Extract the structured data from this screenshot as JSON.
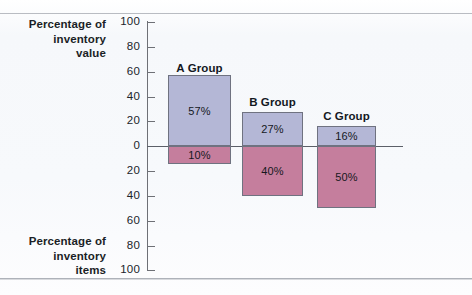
{
  "chart_data": {
    "type": "bar",
    "title": "",
    "subtitle": "",
    "orientation": "vertical-diverging",
    "categories": [
      "A Group",
      "B Group",
      "C Group"
    ],
    "series": [
      {
        "name": "Percentage of inventory value",
        "direction": "up",
        "color": "#b4b7d6",
        "values": [
          57,
          27,
          16
        ],
        "labels": [
          "57%",
          "27%",
          "16%"
        ]
      },
      {
        "name": "Percentage of inventory items",
        "direction": "down",
        "color": "#c57e9d",
        "values": [
          10,
          40,
          50
        ],
        "labels": [
          "10%",
          "40%",
          "50%"
        ]
      }
    ],
    "upper_axis_label": "Percentage of inventory value",
    "lower_axis_label": "Percentage of inventory items",
    "upper_axis_label_lines": [
      "Percentage of",
      "inventory",
      "value"
    ],
    "lower_axis_label_lines": [
      "Percentage of",
      "inventory",
      "items"
    ],
    "xlabel": "",
    "ylabel": "",
    "ylim": [
      -100,
      100
    ],
    "tick_step": 20,
    "upper_ticks": [
      100,
      80,
      60,
      40,
      20,
      0
    ],
    "lower_ticks": [
      20,
      40,
      60,
      80,
      100
    ],
    "tick_labels": [
      "100",
      "80",
      "60",
      "40",
      "20",
      "0",
      "20",
      "40",
      "60",
      "80",
      "100"
    ],
    "grid": false,
    "legend": "none",
    "baseline_value": 0
  },
  "axis": {
    "ticks": [
      {
        "label": "100",
        "y": 22
      },
      {
        "label": "80",
        "y": 47
      },
      {
        "label": "60",
        "y": 72
      },
      {
        "label": "40",
        "y": 97
      },
      {
        "label": "20",
        "y": 121
      },
      {
        "label": "0",
        "y": 146
      },
      {
        "label": "20",
        "y": 171
      },
      {
        "label": "40",
        "y": 196
      },
      {
        "label": "60",
        "y": 221
      },
      {
        "label": "80",
        "y": 246
      },
      {
        "label": "100",
        "y": 270
      }
    ]
  },
  "groups": [
    {
      "label": "A Group",
      "left": 168,
      "width": 63,
      "label_top": 62,
      "value": {
        "label": "57%",
        "top": 75,
        "height": 71
      },
      "items": {
        "label": "10%",
        "top": 146,
        "height": 18
      }
    },
    {
      "label": "B Group",
      "left": 242,
      "width": 61,
      "label_top": 96,
      "value": {
        "label": "27%",
        "top": 112,
        "height": 34
      },
      "items": {
        "label": "40%",
        "top": 146,
        "height": 50
      }
    },
    {
      "label": "C Group",
      "left": 317,
      "width": 59,
      "label_top": 110,
      "value": {
        "label": "16%",
        "top": 126,
        "height": 20
      },
      "items": {
        "label": "50%",
        "top": 146,
        "height": 62
      }
    }
  ],
  "captions": {
    "value": [
      "Percentage of",
      "inventory",
      "value"
    ],
    "items": [
      "Percentage of",
      "inventory",
      "items"
    ]
  },
  "colors": {
    "value_fill": "#b4b7d6",
    "items_fill": "#c57e9d",
    "bar_border": "#6f7280",
    "axis": "#6e7076",
    "text": "#1b1f26",
    "background": "#f7f9fc"
  }
}
